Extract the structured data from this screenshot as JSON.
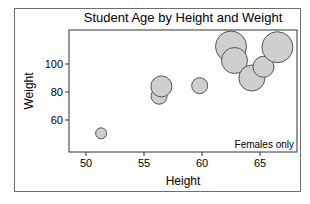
{
  "chart_data": {
    "type": "bubble",
    "title": "Student Age by Height and Weight",
    "xlabel": "Height",
    "ylabel": "Weight",
    "annotation": "Females only",
    "xlim": [
      48.5,
      68.0
    ],
    "ylim": [
      39.5,
      124.0
    ],
    "xticks": [
      50,
      55,
      60,
      65
    ],
    "yticks": [
      60,
      80,
      100
    ],
    "grid": false,
    "legend": null,
    "size_variable": "Age",
    "bubble_fill": "#cfcfcf",
    "bubble_stroke": "#555555",
    "points": [
      {
        "x": 51.3,
        "y": 50.5,
        "size": 11
      },
      {
        "x": 56.3,
        "y": 77.0,
        "size": 12
      },
      {
        "x": 56.5,
        "y": 84.0,
        "size": 13
      },
      {
        "x": 59.8,
        "y": 84.5,
        "size": 12
      },
      {
        "x": 62.5,
        "y": 112.5,
        "size": 15
      },
      {
        "x": 62.8,
        "y": 102.5,
        "size": 14
      },
      {
        "x": 64.3,
        "y": 90.0,
        "size": 14
      },
      {
        "x": 65.3,
        "y": 98.0,
        "size": 13
      },
      {
        "x": 66.5,
        "y": 112.0,
        "size": 15
      }
    ]
  }
}
